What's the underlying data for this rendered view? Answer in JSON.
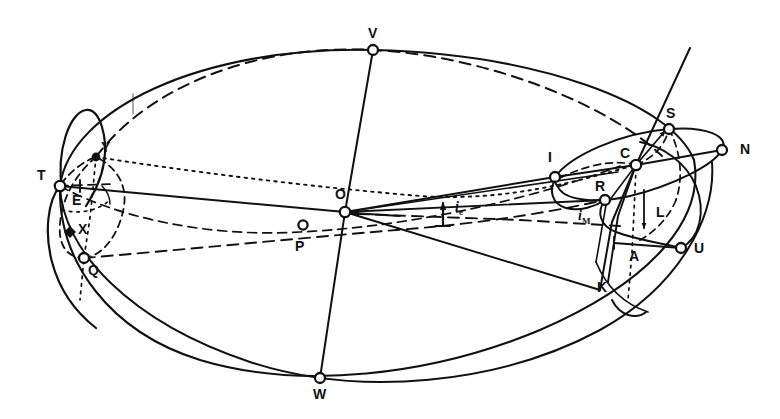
{
  "figure": {
    "kind": "orbital-geometry-diagram",
    "width": 780,
    "height": 419,
    "background": "#ffffff",
    "ink": "#111111"
  },
  "points": [
    {
      "id": "V",
      "label": "V",
      "x": 373,
      "y": 50,
      "marker": "open-circle",
      "lx": 368,
      "ly": 26
    },
    {
      "id": "S",
      "label": "S",
      "x": 669,
      "y": 129,
      "marker": "open-circle",
      "lx": 666,
      "ly": 108
    },
    {
      "id": "N",
      "label": "N",
      "x": 722,
      "y": 150,
      "marker": "open-circle",
      "lx": 740,
      "ly": 142
    },
    {
      "id": "Y",
      "label": "Y",
      "x": 96,
      "y": 157,
      "marker": "filled-dot",
      "lx": 101,
      "ly": 141
    },
    {
      "id": "I",
      "label": "I",
      "x": 555,
      "y": 177,
      "marker": "open-circle",
      "lx": 548,
      "ly": 152
    },
    {
      "id": "C",
      "label": "C",
      "x": 636,
      "y": 165,
      "marker": "open-circle",
      "lx": 620,
      "ly": 148
    },
    {
      "id": "T",
      "label": "T",
      "x": 60,
      "y": 186,
      "marker": "open-circle",
      "lx": 38,
      "ly": 170
    },
    {
      "id": "E",
      "label": "E",
      "x": 80,
      "y": 186,
      "marker": "tick",
      "lx": 73,
      "ly": 194
    },
    {
      "id": "R",
      "label": "R",
      "x": 605,
      "y": 200,
      "marker": "open-circle",
      "lx": 596,
      "ly": 181
    },
    {
      "id": "O",
      "label": "O",
      "x": 345,
      "y": 212,
      "marker": "open-circle",
      "lx": 336,
      "ly": 188
    },
    {
      "id": "X",
      "label": "X",
      "x": 70,
      "y": 232,
      "marker": "filled-diamond",
      "lx": 77,
      "ly": 222
    },
    {
      "id": "P",
      "label": "P",
      "x": 303,
      "y": 225,
      "marker": "open-circle",
      "lx": 296,
      "ly": 240
    },
    {
      "id": "L",
      "label": "L",
      "x": 644,
      "y": 200,
      "marker": "arrow-down",
      "lx": 657,
      "ly": 206
    },
    {
      "id": "U",
      "label": "U",
      "x": 681,
      "y": 248,
      "marker": "open-circle",
      "lx": 693,
      "ly": 248
    },
    {
      "id": "A",
      "label": "A",
      "x": 620,
      "y": 243,
      "marker": "tick",
      "lx": 629,
      "ly": 250
    },
    {
      "id": "Q",
      "label": "Q",
      "x": 84,
      "y": 258,
      "marker": "open-circle",
      "lx": 88,
      "ly": 264
    },
    {
      "id": "K",
      "label": "K",
      "x": 608,
      "y": 282,
      "marker": "none",
      "lx": 598,
      "ly": 281
    },
    {
      "id": "W",
      "label": "W",
      "x": 320,
      "y": 378,
      "marker": "open-circle",
      "lx": 314,
      "ly": 388
    }
  ],
  "angle_labels": [
    {
      "id": "i_e",
      "base": "i",
      "sub": "e",
      "lx": 456,
      "ly": 205,
      "arrow_x": 443,
      "arrow_y0": 225,
      "arrow_y1": 203
    },
    {
      "id": "i_M",
      "base": "i",
      "sub": "M",
      "lx": 580,
      "ly": 214,
      "arrow_x": 0,
      "arrow_y0": 0,
      "arrow_y1": 0
    }
  ],
  "legend": {
    "marker_open_circle": "node / intersection point",
    "marker_filled_dot": "body position",
    "marker_filled_diamond": "body position"
  },
  "colors": {
    "ink": "#111111",
    "background": "#ffffff"
  }
}
